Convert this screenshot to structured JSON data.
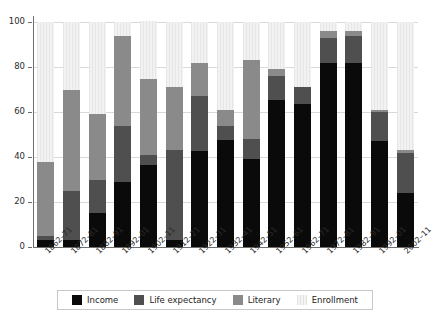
{
  "chart_data": {
    "type": "bar",
    "subtype": "stacked-bar",
    "title": "",
    "subtitle": "",
    "xlabel": "",
    "ylabel": "",
    "ylim": [
      0,
      100
    ],
    "yticks": [
      0,
      20,
      40,
      60,
      80,
      100
    ],
    "ytick_labels": [
      "0",
      "20",
      "40",
      "60",
      "80",
      "100"
    ],
    "grid": true,
    "grid_axis": "y",
    "legend_position": "bottom",
    "categories": [
      "1862–71",
      "1872–81",
      "1882–91",
      "1892–01",
      "1902–11",
      "1912–21",
      "1922–31",
      "1932–41",
      "1942–51",
      "1952–61",
      "1962–71",
      "1972–81",
      "1982–91",
      "1992–01",
      "2002–11"
    ],
    "series": [
      {
        "name": "Income",
        "color": "#0a0a0a",
        "values": [
          3,
          3,
          15,
          29,
          36.5,
          3,
          42.5,
          47.5,
          39,
          65.5,
          63.5,
          82,
          82,
          47,
          24
        ]
      },
      {
        "name": "Life expectancy",
        "color": "#4f4f4f",
        "values": [
          2,
          22,
          15,
          25,
          4.5,
          40,
          24.5,
          6.5,
          9,
          10.5,
          7.5,
          11,
          12,
          13,
          18
        ]
      },
      {
        "name": "Literary",
        "color": "#8a8a8a",
        "values": [
          33,
          45,
          29,
          40,
          33.5,
          28,
          15,
          7,
          35,
          3,
          0,
          3,
          2,
          1,
          1
        ]
      },
      {
        "name": "Enrollment",
        "color": "#ececec",
        "values": [
          62,
          30,
          41,
          6,
          26,
          29,
          18,
          39,
          17,
          21,
          29,
          4,
          4,
          39,
          57
        ]
      }
    ],
    "cumulative_tops": {
      "Income": [
        3,
        3,
        15,
        29,
        36.5,
        3,
        42.5,
        47.5,
        39,
        65.5,
        63.5,
        82,
        82,
        47,
        24
      ],
      "Life expectancy": [
        5,
        25,
        30,
        54,
        41,
        43,
        67,
        54,
        48,
        76,
        71,
        93,
        94,
        60,
        42
      ],
      "Literary": [
        38,
        70,
        59,
        94,
        74.5,
        71,
        82,
        61,
        83,
        79,
        71,
        96,
        96,
        61,
        43
      ],
      "Enrollment": [
        100,
        100,
        100,
        100,
        100,
        100,
        100,
        100,
        100,
        100,
        100,
        100,
        100,
        100,
        100
      ]
    }
  },
  "legend": {
    "items": [
      {
        "label": "Income",
        "color": "#0a0a0a"
      },
      {
        "label": "Life expectancy",
        "color": "#4f4f4f"
      },
      {
        "label": "Literary",
        "color": "#8a8a8a"
      },
      {
        "label": "Enrollment",
        "color": "#ececec"
      }
    ]
  }
}
